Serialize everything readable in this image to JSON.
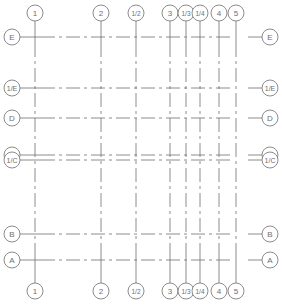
{
  "drawing": {
    "type": "structural-grid-axis-plan",
    "line_color": "#6e6e6e",
    "bubble_color": "#6e6e6e",
    "background": "#ffffff",
    "bubble_radius": 8
  },
  "vertical_axes": [
    {
      "label": "1",
      "x": 35
    },
    {
      "label": "2",
      "x": 101
    },
    {
      "label": "1/2",
      "x": 136
    },
    {
      "label": "3",
      "x": 170
    },
    {
      "label": "1/3",
      "x": 186
    },
    {
      "label": "1/4",
      "x": 200
    },
    {
      "label": "4",
      "x": 219
    },
    {
      "label": "5",
      "x": 236
    }
  ],
  "horizontal_axes": [
    {
      "label": "E",
      "y": 37
    },
    {
      "label": "1/E",
      "y": 88
    },
    {
      "label": "D",
      "y": 118
    },
    {
      "label": "C",
      "y": 155
    },
    {
      "label": "1/C",
      "y": 160
    },
    {
      "label": "B",
      "y": 234
    },
    {
      "label": "A",
      "y": 260
    }
  ],
  "bubbles": {
    "top_y": 13,
    "bottom_y": 291,
    "left_x": 12,
    "right_x": 270
  }
}
